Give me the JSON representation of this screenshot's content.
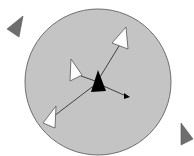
{
  "diagram": {
    "title": "",
    "colors": {
      "background": "#ffffff",
      "range_fill": "#c4c4c4",
      "range_stroke": "#6e6e6e",
      "agent_fill": "#000000",
      "neighbor_fill": "#ffffff",
      "neighbor_stroke": "#555555",
      "outside_fill": "#6e6e6e",
      "link_stroke": "#333333"
    },
    "range_circle": {
      "cx": 98,
      "cy": 82,
      "r": 73
    },
    "agent": {
      "points": "98,70 91,92 106,91"
    },
    "neighbors": [
      {
        "id": "neighbor-top-right",
        "points": "126,27 128,49 112,43"
      },
      {
        "id": "neighbor-mid-left",
        "points": "71,59 82,75 70,81"
      },
      {
        "id": "neighbor-bottom-left",
        "points": "56,106 55,128 43,123"
      }
    ],
    "links": [
      {
        "from": "agent",
        "to": "neighbor-top-right",
        "x1": 100,
        "y1": 77,
        "x2": 119,
        "y2": 46
      },
      {
        "from": "agent",
        "to": "neighbor-mid-left",
        "x1": 98,
        "y1": 82,
        "x2": 81,
        "y2": 76
      },
      {
        "from": "agent",
        "to": "neighbor-bottom-left",
        "x1": 96,
        "y1": 84,
        "x2": 54,
        "y2": 116
      }
    ],
    "heading_arrow": {
      "x1": 99,
      "y1": 84,
      "x2": 126,
      "y2": 96,
      "head": "130,97 124,93 124,99"
    },
    "outside_agents": [
      {
        "id": "outside-top-left",
        "points": "23,16 7,29 19,37"
      },
      {
        "id": "outside-bottom-right",
        "points": "181,123 193,139 181,145"
      }
    ]
  }
}
